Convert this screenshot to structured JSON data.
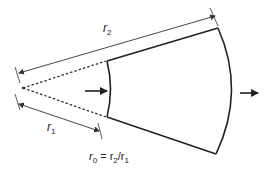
{
  "diagram": {
    "type": "annular-sector-expansion",
    "labels": {
      "outer_radius": "r",
      "outer_radius_sub": "2",
      "inner_radius": "r",
      "inner_radius_sub": "1",
      "ratio_r": "r",
      "ratio_sub0": "0",
      "ratio_eq": " = r",
      "ratio_sub2": "2",
      "ratio_slash": "/r",
      "ratio_sub1": "1"
    },
    "arrows": {
      "inflow": "right",
      "outflow": "right"
    },
    "colors": {
      "stroke": "#222222",
      "dim_line": "#333333",
      "background": "#ffffff"
    }
  }
}
